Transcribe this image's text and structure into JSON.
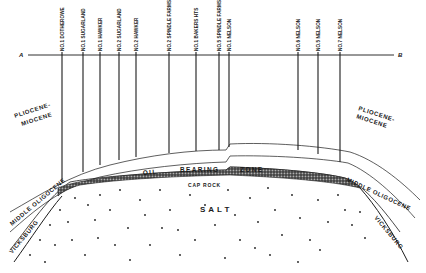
{
  "section": {
    "endpoint_left": "A",
    "endpoint_right": "B"
  },
  "wells": [
    {
      "label": "NO.1 DOTHEROWE",
      "x": 62,
      "bottom": 182
    },
    {
      "label": "NO.1 SUGARLAND",
      "x": 83,
      "bottom": 172
    },
    {
      "label": "NO.1 HAWKER",
      "x": 100,
      "bottom": 165
    },
    {
      "label": "NO.2 SUGARLAND",
      "x": 119,
      "bottom": 160
    },
    {
      "label": "NO.2 HAWKER",
      "x": 136,
      "bottom": 157
    },
    {
      "label": "NO.2 SPINDLE FARMS",
      "x": 169,
      "bottom": 153
    },
    {
      "label": "NO.1 BAKERS HTS",
      "x": 196,
      "bottom": 151
    },
    {
      "label": "NO.5 SPINDLE FARMS",
      "x": 219,
      "bottom": 150
    },
    {
      "label": "NO.1 NELSON",
      "x": 229,
      "bottom": 147
    },
    {
      "label": "NO.6 NELSON",
      "x": 298,
      "bottom": 150
    },
    {
      "label": "NO.5 NELSON",
      "x": 318,
      "bottom": 154
    },
    {
      "label": "NO.7 NELSON",
      "x": 340,
      "bottom": 162
    }
  ],
  "formations": {
    "pliocene_miocene_left": [
      "PLIOCENE-",
      "MIOCENE"
    ],
    "pliocene_miocene_right": [
      "PLIOCENE-",
      "MIOCENE"
    ],
    "oil": "OIL",
    "bearing": "BEARING",
    "zone": "ZONE",
    "cap_rock": "CAP ROCK",
    "salt": "SALT",
    "middle_oligocene_left": "MIDDLE OLIGOCENE",
    "middle_oligocene_right": "MIDDLE OLIGOCENE",
    "vicksburg_left": "VICKSBURG",
    "vicksburg_right": "VICKSBURG"
  },
  "colors": {
    "ink": "#1a1a1a",
    "background": "#ffffff"
  }
}
